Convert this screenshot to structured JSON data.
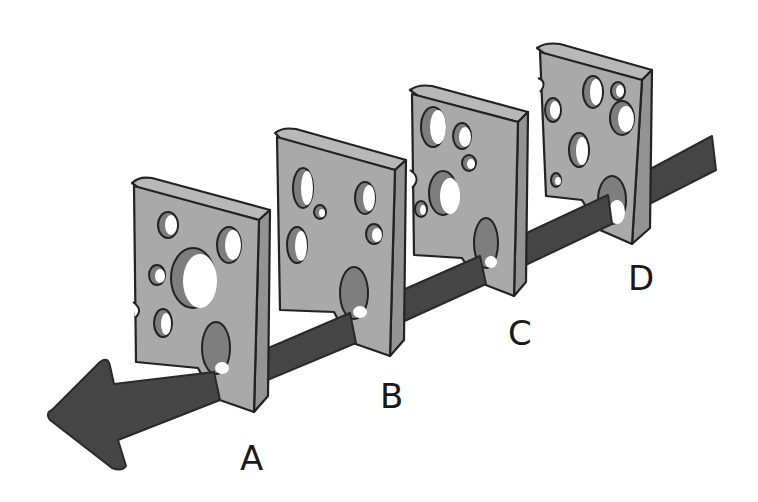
{
  "diagram": {
    "type": "swiss-cheese-model",
    "slices": [
      {
        "id": "A",
        "label": "A"
      },
      {
        "id": "B",
        "label": "B"
      },
      {
        "id": "C",
        "label": "C"
      },
      {
        "id": "D",
        "label": "D"
      }
    ],
    "arrow": {
      "direction": "right-to-left",
      "passes_through": [
        "D",
        "C",
        "B",
        "A"
      ]
    },
    "colors": {
      "slice_face": "#a9a9a9",
      "slice_top": "#b8b8b8",
      "slice_side": "#939393",
      "arrow": "#454545",
      "background": "#ffffff"
    }
  }
}
